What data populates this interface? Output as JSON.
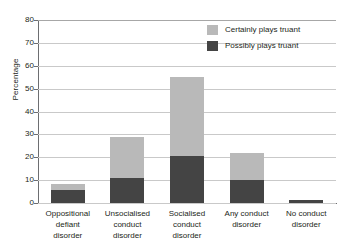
{
  "chart_data": {
    "type": "bar",
    "subtype": "stacked-bar",
    "title": "",
    "xlabel": "",
    "ylabel": "Percentage",
    "ylim": [
      0,
      80
    ],
    "ytick_step": 10,
    "yticks": [
      80,
      70,
      60,
      50,
      40,
      30,
      20,
      10,
      0
    ],
    "grid": true,
    "legend_position": "top-right",
    "categories": [
      "Oppositional defiant disorder",
      "Unsocialised conduct disorder",
      "Socialised conduct disorder",
      "Any conduct disorder",
      "No conduct disorder"
    ],
    "category_lines": [
      [
        "Oppositional",
        "defiant",
        "disorder"
      ],
      [
        "Unsocialised",
        "conduct",
        "disorder"
      ],
      [
        "Socialised",
        "conduct",
        "disorder"
      ],
      [
        "Any conduct",
        "disorder"
      ],
      [
        "No conduct",
        "disorder"
      ]
    ],
    "series": [
      {
        "name": "Possibly plays truant",
        "color": "#444444",
        "values": [
          5.5,
          11,
          20.5,
          10,
          1.5
        ]
      },
      {
        "name": "Certainly plays truant",
        "color": "#b9b9b9",
        "values": [
          3,
          18,
          34.5,
          12,
          0
        ]
      }
    ],
    "totals": [
      8.5,
      29,
      55,
      22,
      1.5
    ]
  },
  "legend": {
    "items": [
      {
        "label": "Certainly plays truant",
        "color": "#b9b9b9"
      },
      {
        "label": "Possibly plays truant",
        "color": "#444444"
      }
    ]
  },
  "axis": {
    "y_title": "Percentage"
  }
}
